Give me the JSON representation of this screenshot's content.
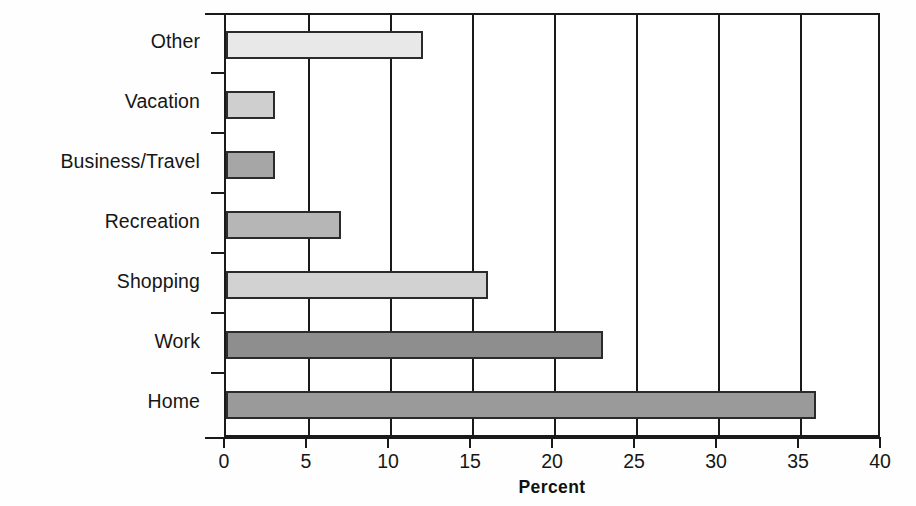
{
  "chart_data": {
    "type": "bar",
    "orientation": "horizontal",
    "title": "",
    "xlabel": "Percent",
    "ylabel": "",
    "xlim": [
      0,
      40
    ],
    "xticks": [
      0,
      5,
      10,
      15,
      20,
      25,
      30,
      35,
      40
    ],
    "grid": "vertical gridlines at every x tick",
    "legend": "none",
    "categories": [
      "Home",
      "Work",
      "Shopping",
      "Recreation",
      "Business/Travel",
      "Vacation",
      "Other"
    ],
    "values": [
      36,
      23,
      16,
      7,
      3,
      3,
      12
    ],
    "bar_fills": [
      "#9a9a9a",
      "#8e8e8e",
      "#d2d2d2",
      "#b6b6b6",
      "#a6a6a6",
      "#cfcfcf",
      "#e8e8e8"
    ],
    "bars": [
      {
        "label": "Other",
        "value": 12,
        "fill": "#e8e8e8"
      },
      {
        "label": "Vacation",
        "value": 3,
        "fill": "#cfcfcf"
      },
      {
        "label": "Business/Travel",
        "value": 3,
        "fill": "#a6a6a6"
      },
      {
        "label": "Recreation",
        "value": 7,
        "fill": "#b6b6b6"
      },
      {
        "label": "Shopping",
        "value": 16,
        "fill": "#d2d2d2"
      },
      {
        "label": "Work",
        "value": 23,
        "fill": "#8e8e8e"
      },
      {
        "label": "Home",
        "value": 36,
        "fill": "#9a9a9a"
      }
    ]
  },
  "axis": {
    "x_tick_labels": [
      "0",
      "5",
      "10",
      "15",
      "20",
      "25",
      "30",
      "35",
      "40"
    ],
    "x_title": "Percent"
  },
  "colors": {
    "axis": "#1a1a1a",
    "bar_outline": "#2b2b2b",
    "text": "#161616",
    "plot_background": "#ffffff",
    "page_background": "#fefefe"
  }
}
